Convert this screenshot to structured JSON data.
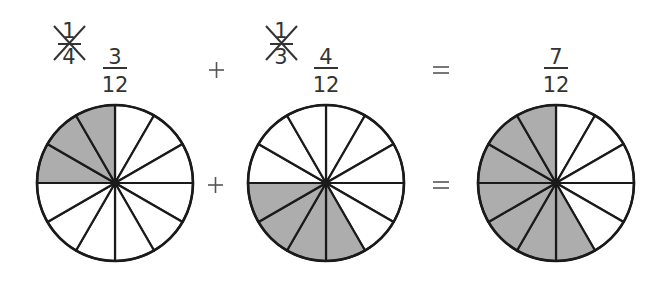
{
  "equation": {
    "terms": [
      {
        "original_fraction": {
          "numerator": "1",
          "denominator": "4",
          "crossed_out": true
        },
        "equivalent_fraction": {
          "numerator": "3",
          "denominator": "12"
        },
        "circle": {
          "sectors": 12,
          "shaded": [
            9,
            10,
            11
          ]
        }
      },
      {
        "original_fraction": {
          "numerator": "1",
          "denominator": "3",
          "crossed_out": true
        },
        "equivalent_fraction": {
          "numerator": "4",
          "denominator": "12"
        },
        "circle": {
          "sectors": 12,
          "shaded": [
            5,
            6,
            7,
            8
          ]
        }
      },
      {
        "result_fraction": {
          "numerator": "7",
          "denominator": "12"
        },
        "circle": {
          "sectors": 12,
          "shaded": [
            5,
            6,
            7,
            8,
            9,
            10,
            11
          ]
        }
      }
    ],
    "operators": [
      "+",
      "="
    ]
  },
  "colors": {
    "shade": "#adadad",
    "line": "#1a1a1a",
    "text": "#333333",
    "background": "#ffffff"
  }
}
